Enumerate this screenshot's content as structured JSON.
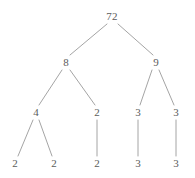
{
  "figure": {
    "kind": "factor-tree",
    "title": "",
    "background_color": "#ffffff",
    "edge_color": "#9a9a9a",
    "text_color": "#5b5b5b",
    "width": 195,
    "height": 178
  },
  "chart_data": {
    "type": "diagram",
    "subtype": "factor-tree",
    "title": "",
    "root": "72",
    "levels": [
      [
        "72"
      ],
      [
        "8",
        "9"
      ],
      [
        "4",
        "2",
        "3",
        "3"
      ],
      [
        "2",
        "2",
        "2",
        "3",
        "3"
      ]
    ],
    "nodes": [
      {
        "id": "n0",
        "label": "72",
        "x": 112,
        "y": 16,
        "level": 0
      },
      {
        "id": "n1",
        "label": "8",
        "x": 66,
        "y": 62,
        "level": 1
      },
      {
        "id": "n2",
        "label": "9",
        "x": 156,
        "y": 62,
        "level": 1
      },
      {
        "id": "n3",
        "label": "4",
        "x": 36,
        "y": 112,
        "level": 2
      },
      {
        "id": "n4",
        "label": "2",
        "x": 97,
        "y": 112,
        "level": 2
      },
      {
        "id": "n5",
        "label": "3",
        "x": 138,
        "y": 112,
        "level": 2
      },
      {
        "id": "n6",
        "label": "3",
        "x": 176,
        "y": 112,
        "level": 2
      },
      {
        "id": "n7",
        "label": "2",
        "x": 15,
        "y": 163,
        "level": 3
      },
      {
        "id": "n8",
        "label": "2",
        "x": 54,
        "y": 163,
        "level": 3
      },
      {
        "id": "n9",
        "label": "2",
        "x": 97,
        "y": 163,
        "level": 3
      },
      {
        "id": "n10",
        "label": "3",
        "x": 138,
        "y": 163,
        "level": 3
      },
      {
        "id": "n11",
        "label": "3",
        "x": 176,
        "y": 163,
        "level": 3
      }
    ],
    "edges": [
      {
        "from": "n0",
        "to": "n1",
        "x1": 107,
        "y1": 24,
        "x2": 70,
        "y2": 55
      },
      {
        "from": "n0",
        "to": "n2",
        "x1": 118,
        "y1": 24,
        "x2": 153,
        "y2": 55
      },
      {
        "from": "n1",
        "to": "n3",
        "x1": 62,
        "y1": 70,
        "x2": 39,
        "y2": 105
      },
      {
        "from": "n1",
        "to": "n4",
        "x1": 70,
        "y1": 70,
        "x2": 95,
        "y2": 105
      },
      {
        "from": "n2",
        "to": "n5",
        "x1": 152,
        "y1": 70,
        "x2": 140,
        "y2": 105
      },
      {
        "from": "n2",
        "to": "n6",
        "x1": 159,
        "y1": 70,
        "x2": 174,
        "y2": 105
      },
      {
        "from": "n3",
        "to": "n7",
        "x1": 33,
        "y1": 120,
        "x2": 18,
        "y2": 156
      },
      {
        "from": "n3",
        "to": "n8",
        "x1": 39,
        "y1": 120,
        "x2": 52,
        "y2": 156
      },
      {
        "from": "n4",
        "to": "n9",
        "x1": 97,
        "y1": 120,
        "x2": 97,
        "y2": 156
      },
      {
        "from": "n5",
        "to": "n10",
        "x1": 138,
        "y1": 120,
        "x2": 138,
        "y2": 156
      },
      {
        "from": "n6",
        "to": "n11",
        "x1": 176,
        "y1": 120,
        "x2": 176,
        "y2": 156
      }
    ]
  }
}
